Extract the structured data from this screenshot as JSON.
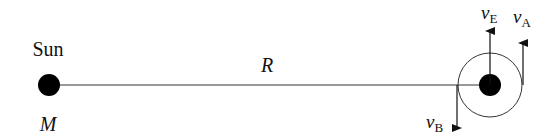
{
  "diagram": {
    "sun": {
      "label": "Sun",
      "mass_label": "M"
    },
    "distance_label": "R",
    "velocities": {
      "vE": {
        "symbol": "v",
        "subscript": "E"
      },
      "vA": {
        "symbol": "v",
        "subscript": "A"
      },
      "vB": {
        "symbol": "v",
        "subscript": "B"
      }
    },
    "colors": {
      "stroke": "#111111",
      "fill": "#000000",
      "background": "#ffffff"
    }
  }
}
